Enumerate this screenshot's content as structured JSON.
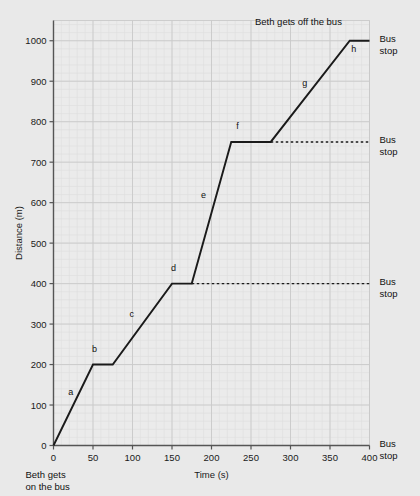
{
  "chart_data": {
    "type": "line",
    "title": "",
    "xlabel": "Time (s)",
    "ylabel": "Distance (m)",
    "xlim": [
      0,
      400
    ],
    "ylim": [
      0,
      1050
    ],
    "x_ticks": [
      0,
      50,
      100,
      150,
      200,
      250,
      300,
      350,
      400
    ],
    "y_ticks": [
      0,
      100,
      200,
      300,
      400,
      500,
      600,
      700,
      800,
      900,
      1000
    ],
    "x_major_step": 50,
    "y_major_step": 100,
    "x_minor_step": 10,
    "y_minor_step": 20,
    "grid": true,
    "legend": "none",
    "x": [
      0,
      50,
      75,
      150,
      175,
      225,
      275,
      375,
      400
    ],
    "y": [
      0,
      200,
      200,
      400,
      400,
      750,
      750,
      1000,
      1000
    ],
    "segments": [
      {
        "label": "a",
        "x0": 0,
        "y0": 0,
        "x1": 50,
        "y1": 200
      },
      {
        "label": "b",
        "x0": 50,
        "y0": 200,
        "x1": 75,
        "y1": 200
      },
      {
        "label": "c",
        "x0": 75,
        "y0": 200,
        "x1": 150,
        "y1": 400
      },
      {
        "label": "d",
        "x0": 150,
        "y0": 400,
        "x1": 175,
        "y1": 400
      },
      {
        "label": "e",
        "x0": 175,
        "y0": 400,
        "x1": 225,
        "y1": 750
      },
      {
        "label": "f",
        "x0": 225,
        "y0": 750,
        "x1": 275,
        "y1": 750
      },
      {
        "label": "g",
        "x0": 275,
        "y0": 750,
        "x1": 375,
        "y1": 1000
      },
      {
        "label": "h",
        "x0": 375,
        "y0": 1000,
        "x1": 400,
        "y1": 1000
      }
    ],
    "segment_label_positions": [
      {
        "label": "a",
        "x": 22,
        "y": 125
      },
      {
        "label": "b",
        "x": 52,
        "y": 232
      },
      {
        "label": "c",
        "x": 99,
        "y": 318
      },
      {
        "label": "d",
        "x": 152,
        "y": 432
      },
      {
        "label": "e",
        "x": 190,
        "y": 612
      },
      {
        "label": "f",
        "x": 233,
        "y": 782
      },
      {
        "label": "g",
        "x": 318,
        "y": 888
      },
      {
        "label": "h",
        "x": 380,
        "y": 972
      }
    ],
    "reference_lines": [
      {
        "y": 400,
        "x0": 175,
        "x1": 400,
        "style": "dashed"
      },
      {
        "y": 750,
        "x0": 275,
        "x1": 400,
        "style": "dashed"
      }
    ],
    "annotations": [
      {
        "name": "gets-off-note",
        "text": "Beth gets off the bus",
        "x": 255,
        "y": 1040
      },
      {
        "name": "gets-on-note",
        "text": "Beth gets on the bus",
        "x": 0,
        "y": -95
      }
    ],
    "right_labels": [
      {
        "text": "Bus stop",
        "y": 1000
      },
      {
        "text": "Bus stop",
        "y": 750
      },
      {
        "text": "Bus stop",
        "y": 400
      },
      {
        "text": "Bus stop",
        "y": 0
      }
    ],
    "line_color": "#1a1a1a",
    "grid_color": "#c9c9c9",
    "minor_grid_color": "#dddddd",
    "background_color": "#e9e9e9",
    "plot_background_color": "#ebebeb"
  },
  "axes": {
    "x_title": "Time (s)",
    "y_title": "Distance (m)",
    "x_tick_labels": [
      "0",
      "50",
      "100",
      "150",
      "200",
      "250",
      "300",
      "350",
      "400"
    ],
    "y_tick_labels": [
      "1000",
      "900",
      "800",
      "700",
      "600",
      "500",
      "400",
      "300",
      "200",
      "100",
      "0"
    ]
  },
  "labels": {
    "bus_stop_line1": "Bus",
    "bus_stop_line2": "stop",
    "gets_off": "Beth gets off the bus",
    "gets_on_line1": "Beth gets",
    "gets_on_line2": "on the bus",
    "segments": [
      "a",
      "b",
      "c",
      "d",
      "e",
      "f",
      "g",
      "h"
    ]
  },
  "cutoff_text": ""
}
